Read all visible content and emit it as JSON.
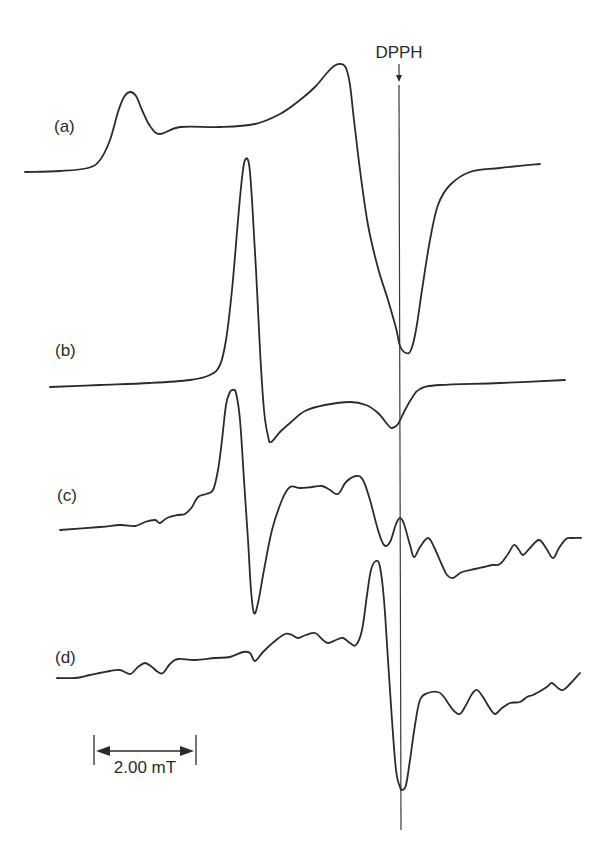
{
  "chart_data": {
    "type": "line",
    "title": "",
    "xlabel": "Magnetic field",
    "ylabel": "EPR signal (first derivative, arbitrary units)",
    "grid": false,
    "axes_visible": false,
    "reference_marker": {
      "label": "DPPH",
      "x_px": 399,
      "y_top_px": 80,
      "y_bottom_px": 830
    },
    "scale_bar": {
      "label": "2.00 mT",
      "x1_px": 94,
      "x2_px": 196,
      "y_px": 751
    },
    "series": [
      {
        "name": "(a)",
        "label_pos": [
          54,
          132
        ],
        "points": [
          [
            25,
            172
          ],
          [
            60,
            171
          ],
          [
            88,
            168
          ],
          [
            100,
            160
          ],
          [
            110,
            140
          ],
          [
            118,
            112
          ],
          [
            124,
            97
          ],
          [
            130,
            92
          ],
          [
            136,
            96
          ],
          [
            142,
            110
          ],
          [
            150,
            126
          ],
          [
            160,
            134
          ],
          [
            180,
            127
          ],
          [
            220,
            127
          ],
          [
            255,
            124
          ],
          [
            280,
            114
          ],
          [
            300,
            100
          ],
          [
            315,
            87
          ],
          [
            326,
            74
          ],
          [
            334,
            66
          ],
          [
            341,
            64
          ],
          [
            346,
            68
          ],
          [
            350,
            85
          ],
          [
            354,
            120
          ],
          [
            360,
            170
          ],
          [
            368,
            225
          ],
          [
            378,
            268
          ],
          [
            388,
            300
          ],
          [
            396,
            328
          ],
          [
            400,
            346
          ],
          [
            406,
            353
          ],
          [
            411,
            350
          ],
          [
            416,
            330
          ],
          [
            422,
            290
          ],
          [
            430,
            240
          ],
          [
            438,
            205
          ],
          [
            450,
            185
          ],
          [
            470,
            172
          ],
          [
            500,
            168
          ],
          [
            540,
            164
          ]
        ]
      },
      {
        "name": "(b)",
        "label_pos": [
          55,
          356
        ],
        "points": [
          [
            50,
            387
          ],
          [
            100,
            385
          ],
          [
            150,
            383
          ],
          [
            190,
            380
          ],
          [
            210,
            375
          ],
          [
            220,
            365
          ],
          [
            226,
            340
          ],
          [
            232,
            290
          ],
          [
            238,
            220
          ],
          [
            242,
            178
          ],
          [
            245,
            160
          ],
          [
            249,
            164
          ],
          [
            252,
            200
          ],
          [
            256,
            270
          ],
          [
            260,
            350
          ],
          [
            264,
            410
          ],
          [
            268,
            436
          ],
          [
            271,
            442
          ],
          [
            280,
            432
          ],
          [
            290,
            423
          ],
          [
            305,
            411
          ],
          [
            325,
            405
          ],
          [
            350,
            402
          ],
          [
            366,
            405
          ],
          [
            378,
            413
          ],
          [
            388,
            425
          ],
          [
            392,
            428
          ],
          [
            398,
            424
          ],
          [
            404,
            412
          ],
          [
            412,
            398
          ],
          [
            420,
            389
          ],
          [
            440,
            385
          ],
          [
            500,
            383
          ],
          [
            565,
            380
          ]
        ]
      },
      {
        "name": "(c)",
        "label_pos": [
          57,
          501
        ],
        "points": [
          [
            60,
            530
          ],
          [
            100,
            527
          ],
          [
            120,
            525
          ],
          [
            135,
            526
          ],
          [
            145,
            522
          ],
          [
            155,
            520
          ],
          [
            160,
            523
          ],
          [
            167,
            518
          ],
          [
            178,
            515
          ],
          [
            185,
            514
          ],
          [
            192,
            507
          ],
          [
            198,
            497
          ],
          [
            206,
            494
          ],
          [
            213,
            490
          ],
          [
            218,
            470
          ],
          [
            222,
            440
          ],
          [
            226,
            405
          ],
          [
            230,
            392
          ],
          [
            233,
            390
          ],
          [
            236,
            393
          ],
          [
            240,
            420
          ],
          [
            244,
            480
          ],
          [
            248,
            540
          ],
          [
            251,
            590
          ],
          [
            254,
            613
          ],
          [
            258,
            603
          ],
          [
            264,
            570
          ],
          [
            272,
            530
          ],
          [
            282,
            500
          ],
          [
            290,
            487
          ],
          [
            300,
            488
          ],
          [
            312,
            487
          ],
          [
            322,
            486
          ],
          [
            330,
            490
          ],
          [
            338,
            494
          ],
          [
            346,
            482
          ],
          [
            356,
            476
          ],
          [
            363,
            480
          ],
          [
            370,
            500
          ],
          [
            378,
            530
          ],
          [
            384,
            545
          ],
          [
            390,
            542
          ],
          [
            396,
            524
          ],
          [
            400,
            518
          ],
          [
            404,
            524
          ],
          [
            410,
            545
          ],
          [
            414,
            557
          ],
          [
            420,
            547
          ],
          [
            428,
            538
          ],
          [
            434,
            547
          ],
          [
            442,
            565
          ],
          [
            447,
            575
          ],
          [
            453,
            578
          ],
          [
            462,
            572
          ],
          [
            475,
            569
          ],
          [
            484,
            567
          ],
          [
            492,
            565
          ],
          [
            500,
            564
          ],
          [
            508,
            554
          ],
          [
            514,
            545
          ],
          [
            519,
            550
          ],
          [
            523,
            555
          ],
          [
            530,
            548
          ],
          [
            539,
            540
          ],
          [
            546,
            548
          ],
          [
            553,
            558
          ],
          [
            559,
            548
          ],
          [
            566,
            539
          ],
          [
            572,
            538
          ],
          [
            581,
            538
          ]
        ]
      },
      {
        "name": "(d)",
        "label_pos": [
          55,
          663
        ],
        "points": [
          [
            57,
            678
          ],
          [
            75,
            678
          ],
          [
            90,
            675
          ],
          [
            110,
            671
          ],
          [
            120,
            670
          ],
          [
            130,
            674
          ],
          [
            138,
            667
          ],
          [
            145,
            663
          ],
          [
            152,
            667
          ],
          [
            158,
            672
          ],
          [
            163,
            673
          ],
          [
            170,
            664
          ],
          [
            178,
            659
          ],
          [
            195,
            660
          ],
          [
            215,
            658
          ],
          [
            230,
            657
          ],
          [
            243,
            652
          ],
          [
            250,
            653
          ],
          [
            255,
            661
          ],
          [
            263,
            652
          ],
          [
            275,
            641
          ],
          [
            285,
            634
          ],
          [
            292,
            635
          ],
          [
            298,
            638
          ],
          [
            306,
            635
          ],
          [
            315,
            633
          ],
          [
            322,
            639
          ],
          [
            328,
            643
          ],
          [
            336,
            640
          ],
          [
            343,
            638
          ],
          [
            350,
            643
          ],
          [
            356,
            645
          ],
          [
            362,
            630
          ],
          [
            367,
            595
          ],
          [
            371,
            570
          ],
          [
            376,
            561
          ],
          [
            380,
            567
          ],
          [
            384,
            600
          ],
          [
            388,
            660
          ],
          [
            392,
            720
          ],
          [
            396,
            770
          ],
          [
            400,
            787
          ],
          [
            402,
            790
          ],
          [
            406,
            785
          ],
          [
            410,
            760
          ],
          [
            415,
            725
          ],
          [
            420,
            700
          ],
          [
            428,
            693
          ],
          [
            438,
            692
          ],
          [
            444,
            697
          ],
          [
            448,
            703
          ],
          [
            454,
            711
          ],
          [
            460,
            714
          ],
          [
            466,
            705
          ],
          [
            472,
            694
          ],
          [
            477,
            690
          ],
          [
            483,
            697
          ],
          [
            489,
            707
          ],
          [
            495,
            714
          ],
          [
            502,
            708
          ],
          [
            510,
            703
          ],
          [
            520,
            702
          ],
          [
            527,
            697
          ],
          [
            533,
            695
          ],
          [
            542,
            690
          ],
          [
            548,
            686
          ],
          [
            552,
            683
          ],
          [
            558,
            688
          ],
          [
            563,
            690
          ],
          [
            570,
            684
          ],
          [
            580,
            673
          ]
        ]
      }
    ]
  }
}
